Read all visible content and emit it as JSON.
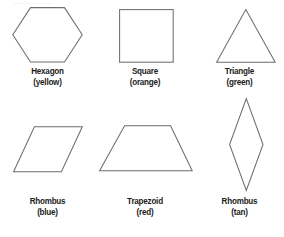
{
  "figure": {
    "background_color": "#ffffff",
    "outline_color": "#6e6e70",
    "label_color": "#1b1b1b",
    "top_artifact_text": "—— —— — ———",
    "rows": 2,
    "columns": 3
  },
  "shapes": [
    {
      "id": "hexagon",
      "name": "Hexagon",
      "color_label": "(yellow)",
      "color_name": "yellow",
      "color_hex": "#f2d335",
      "sides": 6,
      "icon": "hexagon-icon"
    },
    {
      "id": "square",
      "name": "Square",
      "color_label": "(orange)",
      "color_name": "orange",
      "color_hex": "#e88a28",
      "sides": 4,
      "icon": "square-icon"
    },
    {
      "id": "triangle",
      "name": "Triangle",
      "color_label": "(green)",
      "color_name": "green",
      "color_hex": "#3ea64b",
      "sides": 3,
      "icon": "triangle-icon"
    },
    {
      "id": "rhombus-blue",
      "name": "Rhombus",
      "color_label": "(blue)",
      "color_name": "blue",
      "color_hex": "#2f62ad",
      "sides": 4,
      "icon": "rhombus-wide-icon"
    },
    {
      "id": "trapezoid",
      "name": "Trapezoid",
      "color_label": "(red)",
      "color_name": "red",
      "color_hex": "#d3302c",
      "sides": 4,
      "icon": "trapezoid-icon"
    },
    {
      "id": "rhombus-tan",
      "name": "Rhombus",
      "color_label": "(tan)",
      "color_name": "tan",
      "color_hex": "#d6b98c",
      "sides": 4,
      "icon": "rhombus-narrow-icon"
    }
  ]
}
